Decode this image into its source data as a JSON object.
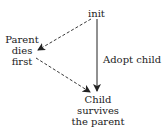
{
  "nodes": {
    "init": "init",
    "parent_dies": [
      "Parent",
      "dies",
      "first"
    ],
    "child": [
      "Child",
      "survives",
      "the parent"
    ]
  },
  "edges": {
    "adopt": "Adopt child"
  },
  "colors": {
    "line": "#222222"
  }
}
